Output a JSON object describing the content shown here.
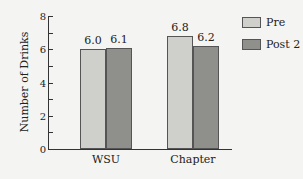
{
  "chart_data": {
    "type": "bar",
    "title": "",
    "xlabel": "",
    "ylabel": "Number of Drinks",
    "ylim": [
      0,
      8
    ],
    "yticks": [
      0,
      2,
      4,
      6,
      8
    ],
    "categories": [
      "WSU",
      "Chapter"
    ],
    "series": [
      {
        "name": "Pre",
        "values": [
          6.0,
          6.8
        ],
        "labels": [
          "6.0",
          "6.8"
        ],
        "color": "#cfcfcb"
      },
      {
        "name": "Post 2",
        "values": [
          6.1,
          6.2
        ],
        "labels": [
          "6.1",
          "6.2"
        ],
        "color": "#8f8f8c"
      }
    ],
    "legend_position": "upper right",
    "grid": false
  }
}
